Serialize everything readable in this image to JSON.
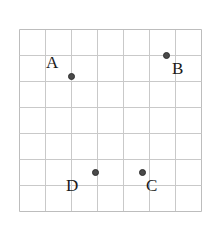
{
  "figure": {
    "background_color": "#ffffff",
    "grid": {
      "left": 19,
      "top": 29,
      "cell_size": 26,
      "columns": 7,
      "rows": 7,
      "line_color": "#c9c9c9",
      "border_color": "#bdbdbd",
      "line_width": 1
    },
    "point_style": {
      "fill_color": "#4a4a4a",
      "edge_color": "#2e2e2e",
      "diameter": 7
    }
  },
  "points": [
    {
      "label": "A",
      "grid_col": 2,
      "grid_row": 1.8,
      "x": 71,
      "y": 76,
      "label_x": 46,
      "label_y": 54,
      "label_position": "upper-left"
    },
    {
      "label": "B",
      "grid_col": 5.65,
      "grid_row": 1,
      "x": 166,
      "y": 55,
      "label_x": 172,
      "label_y": 60,
      "label_position": "lower-right"
    },
    {
      "label": "C",
      "grid_col": 4.73,
      "grid_row": 5.5,
      "x": 142,
      "y": 172,
      "label_x": 146,
      "label_y": 177,
      "label_position": "lower-right"
    },
    {
      "label": "D",
      "grid_col": 2.92,
      "grid_row": 5.5,
      "x": 95,
      "y": 172,
      "label_x": 66,
      "label_y": 177,
      "label_position": "lower-left"
    }
  ]
}
